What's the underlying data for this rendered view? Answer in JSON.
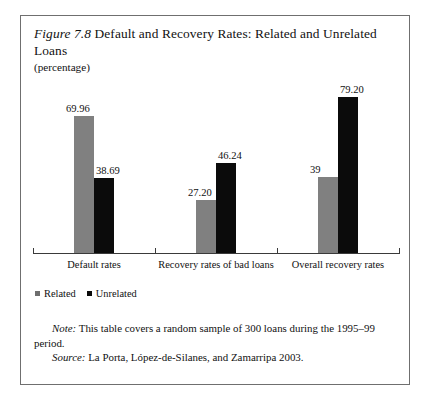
{
  "figure": {
    "label_word": "Figure",
    "number": "7.8",
    "title": "Default and Recovery Rates: Related and Unrelated Loans",
    "subtitle": "(percentage)"
  },
  "legend": {
    "items": [
      {
        "label": "Related",
        "color": "#6e6e6e",
        "marker": "square-marker"
      },
      {
        "label": "Unrelated",
        "color": "#0b0b0b",
        "marker": "square-marker"
      }
    ]
  },
  "footnotes": {
    "note_lead": "Note:",
    "note_text": "This table covers a random sample of 300 loans during the 1995–99 period.",
    "source_lead": "Source:",
    "source_text": "La Porta, López-de-Silanes, and Zamarripa 2003."
  },
  "chart_data": {
    "type": "bar",
    "title": "Figure 7.8 Default and Recovery Rates: Related and Unrelated Loans",
    "subtitle": "(percentage)",
    "xlabel": "",
    "ylabel": "",
    "ylim": [
      0,
      85
    ],
    "grid": false,
    "legend_position": "bottom-left",
    "categories": [
      "Default rates",
      "Recovery rates of bad loans",
      "Overall recovery rates"
    ],
    "series": [
      {
        "name": "Related",
        "color": "#808080",
        "values": [
          69.96,
          27.2,
          39
        ],
        "value_labels": [
          "69.96",
          "27.20",
          "39"
        ]
      },
      {
        "name": "Unrelated",
        "color": "#0b0b0b",
        "values": [
          38.69,
          46.24,
          79.2
        ],
        "value_labels": [
          "38.69",
          "46.24",
          "79.20"
        ]
      }
    ]
  }
}
